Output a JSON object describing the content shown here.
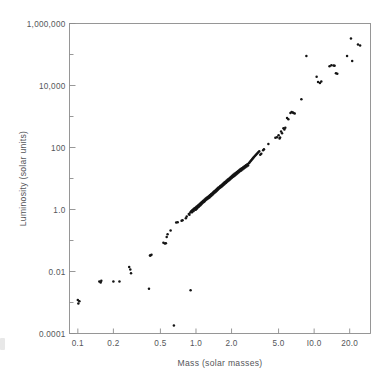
{
  "chart_data": {
    "type": "scatter",
    "title": "",
    "xlabel": "Mass (solar masses)",
    "ylabel": "Luminosity (solar units)",
    "xscale": "log",
    "yscale": "log",
    "xlim": [
      0.085,
      30
    ],
    "ylim": [
      0.0001,
      1000000
    ],
    "grid": false,
    "legend": null,
    "xticks": [
      {
        "value": 0.1,
        "label": "0.1"
      },
      {
        "value": 0.2,
        "label": "0.2"
      },
      {
        "value": 0.5,
        "label": "0.5"
      },
      {
        "value": 1.0,
        "label": "1.0"
      },
      {
        "value": 2.0,
        "label": "2.0"
      },
      {
        "value": 5.0,
        "label": "5.0"
      },
      {
        "value": 10.0,
        "label": "I0.0"
      },
      {
        "value": 20.0,
        "label": "20.0"
      }
    ],
    "yticks": [
      {
        "value": 1000000,
        "label": "1,000,000"
      },
      {
        "value": 10000,
        "label": "10,000"
      },
      {
        "value": 100,
        "label": "100"
      },
      {
        "value": 1.0,
        "label": "1.0"
      },
      {
        "value": 0.01,
        "label": "0.01"
      },
      {
        "value": 0.0001,
        "label": "0.0001"
      }
    ],
    "yminorticks": [
      100000,
      1000,
      10,
      0.1,
      0.001
    ],
    "point_color": "#141414",
    "point_radius": 1.25,
    "points": [
      [
        0.1,
        0.0012
      ],
      [
        0.101,
        0.00092
      ],
      [
        0.103,
        0.0011
      ],
      [
        0.152,
        0.0048
      ],
      [
        0.158,
        0.005
      ],
      [
        0.156,
        0.0044
      ],
      [
        0.2,
        0.0048
      ],
      [
        0.225,
        0.0048
      ],
      [
        0.272,
        0.014
      ],
      [
        0.278,
        0.0115
      ],
      [
        0.282,
        0.0088
      ],
      [
        0.408,
        0.033
      ],
      [
        0.412,
        0.033
      ],
      [
        0.42,
        0.035
      ],
      [
        0.4,
        0.0028
      ],
      [
        0.53,
        0.085
      ],
      [
        0.545,
        0.08
      ],
      [
        0.556,
        0.082
      ],
      [
        0.575,
        0.16
      ],
      [
        0.565,
        0.13
      ],
      [
        0.61,
        0.21
      ],
      [
        0.65,
        0.00018
      ],
      [
        0.68,
        0.38
      ],
      [
        0.7,
        0.39
      ],
      [
        0.755,
        0.43
      ],
      [
        0.77,
        0.45
      ],
      [
        0.82,
        0.52
      ],
      [
        0.835,
        0.6
      ],
      [
        0.87,
        0.72
      ],
      [
        0.88,
        0.68
      ],
      [
        0.895,
        0.8
      ],
      [
        0.9,
        0.0025
      ],
      [
        0.91,
        0.88
      ],
      [
        0.925,
        0.82
      ],
      [
        0.93,
        0.95
      ],
      [
        0.945,
        1.0
      ],
      [
        0.955,
        0.9
      ],
      [
        0.965,
        1.05
      ],
      [
        0.975,
        1.1
      ],
      [
        0.985,
        0.98
      ],
      [
        0.995,
        1.15
      ],
      [
        1.0,
        1.0
      ],
      [
        1.01,
        1.22
      ],
      [
        1.02,
        1.08
      ],
      [
        1.03,
        1.3
      ],
      [
        1.04,
        1.18
      ],
      [
        1.05,
        1.4
      ],
      [
        1.06,
        1.25
      ],
      [
        1.075,
        1.5
      ],
      [
        1.085,
        1.35
      ],
      [
        1.095,
        1.6
      ],
      [
        1.105,
        1.45
      ],
      [
        1.115,
        1.72
      ],
      [
        1.125,
        1.55
      ],
      [
        1.14,
        1.85
      ],
      [
        1.15,
        1.68
      ],
      [
        1.16,
        1.95
      ],
      [
        1.175,
        1.78
      ],
      [
        1.185,
        2.1
      ],
      [
        1.195,
        1.9
      ],
      [
        1.21,
        2.25
      ],
      [
        1.22,
        2.05
      ],
      [
        1.235,
        2.4
      ],
      [
        1.245,
        2.18
      ],
      [
        1.26,
        2.55
      ],
      [
        1.27,
        2.3
      ],
      [
        1.285,
        2.7
      ],
      [
        1.3,
        2.45
      ],
      [
        1.31,
        2.9
      ],
      [
        1.325,
        2.62
      ],
      [
        1.34,
        3.1
      ],
      [
        1.35,
        2.8
      ],
      [
        1.365,
        3.3
      ],
      [
        1.38,
        3.0
      ],
      [
        1.395,
        3.55
      ],
      [
        1.405,
        3.2
      ],
      [
        1.42,
        3.8
      ],
      [
        1.435,
        3.45
      ],
      [
        1.45,
        4.05
      ],
      [
        1.465,
        3.7
      ],
      [
        1.48,
        4.35
      ],
      [
        1.495,
        3.95
      ],
      [
        1.51,
        4.65
      ],
      [
        1.525,
        4.25
      ],
      [
        1.54,
        5.0
      ],
      [
        1.555,
        4.55
      ],
      [
        1.575,
        5.35
      ],
      [
        1.59,
        4.9
      ],
      [
        1.605,
        5.7
      ],
      [
        1.62,
        5.2
      ],
      [
        1.64,
        6.1
      ],
      [
        1.655,
        5.55
      ],
      [
        1.675,
        6.55
      ],
      [
        1.69,
        5.95
      ],
      [
        1.71,
        7.0
      ],
      [
        1.73,
        6.4
      ],
      [
        1.745,
        7.5
      ],
      [
        1.765,
        6.85
      ],
      [
        1.785,
        8.05
      ],
      [
        1.8,
        7.35
      ],
      [
        1.82,
        8.6
      ],
      [
        1.84,
        7.85
      ],
      [
        1.86,
        9.2
      ],
      [
        1.88,
        8.4
      ],
      [
        1.9,
        9.9
      ],
      [
        1.92,
        9.0
      ],
      [
        1.94,
        10.6
      ],
      [
        1.96,
        9.65
      ],
      [
        1.985,
        11.4
      ],
      [
        2.005,
        10.4
      ],
      [
        2.025,
        12.2
      ],
      [
        2.05,
        11.1
      ],
      [
        2.07,
        13.1
      ],
      [
        2.095,
        11.9
      ],
      [
        2.12,
        14.1
      ],
      [
        2.145,
        12.8
      ],
      [
        2.17,
        15.1
      ],
      [
        2.195,
        13.7
      ],
      [
        2.22,
        16.2
      ],
      [
        2.245,
        14.7
      ],
      [
        2.275,
        17.4
      ],
      [
        2.3,
        15.8
      ],
      [
        2.33,
        18.7
      ],
      [
        2.355,
        17.0
      ],
      [
        2.385,
        20.1
      ],
      [
        2.415,
        18.2
      ],
      [
        2.445,
        21.6
      ],
      [
        2.475,
        19.6
      ],
      [
        2.51,
        23.2
      ],
      [
        2.54,
        21.0
      ],
      [
        2.575,
        25.0
      ],
      [
        2.61,
        22.6
      ],
      [
        2.645,
        26.9
      ],
      [
        2.68,
        24.3
      ],
      [
        2.72,
        29.0
      ],
      [
        2.76,
        26.2
      ],
      [
        2.8,
        31.2
      ],
      [
        2.845,
        33.6
      ],
      [
        2.89,
        36.2
      ],
      [
        2.935,
        39.0
      ],
      [
        2.985,
        42.0
      ],
      [
        3.03,
        45.2
      ],
      [
        3.08,
        48.7
      ],
      [
        3.135,
        52.5
      ],
      [
        3.19,
        56.5
      ],
      [
        3.245,
        61.0
      ],
      [
        3.305,
        65.5
      ],
      [
        3.365,
        70.5
      ],
      [
        3.43,
        76.0
      ],
      [
        3.5,
        58.0
      ],
      [
        3.57,
        63.0
      ],
      [
        3.7,
        82.0
      ],
      [
        3.76,
        88.0
      ],
      [
        4.1,
        130.0
      ],
      [
        4.7,
        205.0
      ],
      [
        4.85,
        215.0
      ],
      [
        5.0,
        250.0
      ],
      [
        5.1,
        195.0
      ],
      [
        5.15,
        210.0
      ],
      [
        5.25,
        330.0
      ],
      [
        5.35,
        290.0
      ],
      [
        5.5,
        420.0
      ],
      [
        5.6,
        380.0
      ],
      [
        5.7,
        430.0
      ],
      [
        5.9,
        900.0
      ],
      [
        6.05,
        820.0
      ],
      [
        6.3,
        1300.0
      ],
      [
        6.45,
        1400.0
      ],
      [
        6.6,
        1350.0
      ],
      [
        6.7,
        1300.0
      ],
      [
        6.85,
        1250.0
      ],
      [
        7.8,
        3600.0
      ],
      [
        8.6,
        90000.0
      ],
      [
        10.5,
        19000.0
      ],
      [
        10.8,
        13000.0
      ],
      [
        11.2,
        12000.0
      ],
      [
        11.5,
        13500.0
      ],
      [
        13.5,
        42000.0
      ],
      [
        14.0,
        45000.0
      ],
      [
        14.6,
        44000.0
      ],
      [
        14.9,
        43000.0
      ],
      [
        15.3,
        25000.0
      ],
      [
        15.7,
        24000.0
      ],
      [
        19.0,
        90000.0
      ],
      [
        20.5,
        330000.0
      ],
      [
        21.0,
        62000.0
      ],
      [
        23.5,
        210000.0
      ],
      [
        24.5,
        195000.0
      ]
    ]
  }
}
